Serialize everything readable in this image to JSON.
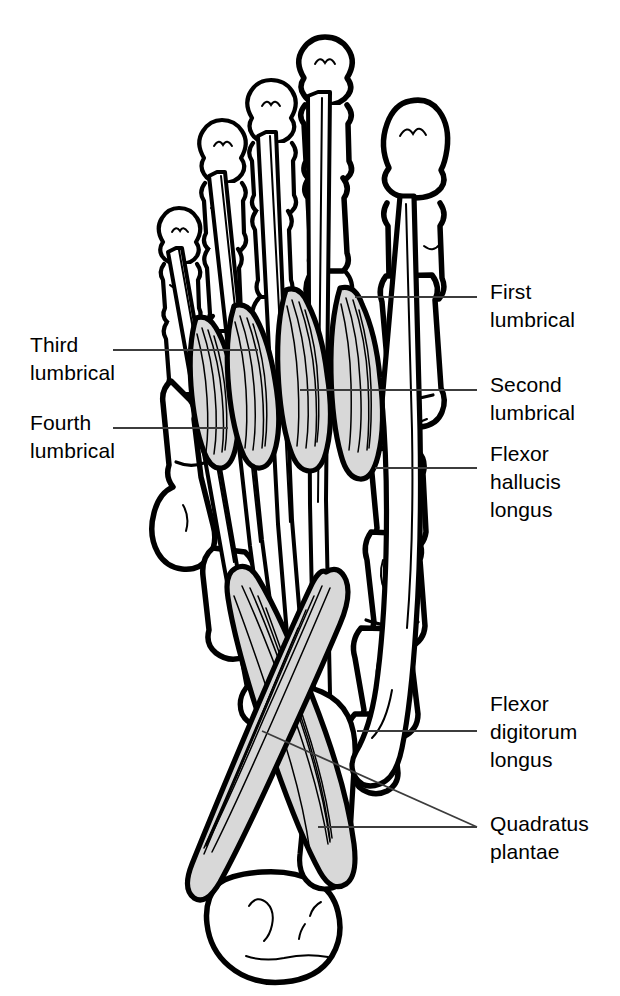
{
  "figure": {
    "background_color": "#ffffff",
    "ink_color": "#000000",
    "muscle_fill_color": "#d8d8d8",
    "bone_fill_color": "#ffffff",
    "leader_color": "#3c3c3c",
    "width": 620,
    "height": 996
  },
  "labels": [
    {
      "id": "first-lumbrical",
      "text": "First\nlumbrical",
      "side": "right",
      "x": 490,
      "y": 278,
      "leader": {
        "x1": 355,
        "y1": 297,
        "x2": 477,
        "y2": 297
      }
    },
    {
      "id": "second-lumbrical",
      "text": "Second\nlumbrical",
      "side": "right",
      "x": 490,
      "y": 371,
      "leader": {
        "x1": 300,
        "y1": 390,
        "x2": 477,
        "y2": 390
      }
    },
    {
      "id": "flexor-hallucis-longus",
      "text": "Flexor\nhallucis\nlongus",
      "side": "right",
      "x": 490,
      "y": 440,
      "leader": {
        "x1": 375,
        "y1": 468,
        "x2": 477,
        "y2": 468
      }
    },
    {
      "id": "flexor-digitorum-longus",
      "text": "Flexor\ndigitorum\nlongus",
      "side": "right",
      "x": 490,
      "y": 690,
      "leader": {
        "x1": 357,
        "y1": 731,
        "x2": 477,
        "y2": 731
      }
    },
    {
      "id": "quadratus-plantae",
      "text": "Quadratus\nplantae",
      "side": "right",
      "x": 490,
      "y": 810,
      "leader_a": {
        "x1": 262,
        "y1": 731,
        "x2": 477,
        "y2": 827
      },
      "leader_b": {
        "x1": 318,
        "y1": 827,
        "x2": 477,
        "y2": 827
      }
    },
    {
      "id": "third-lumbrical",
      "text": "Third\nlumbrical",
      "side": "left",
      "x": 30,
      "y": 331,
      "leader": {
        "x1": 113,
        "y1": 350,
        "x2": 258,
        "y2": 350
      }
    },
    {
      "id": "fourth-lumbrical",
      "text": "Fourth\nlumbrical",
      "side": "left",
      "x": 30,
      "y": 409,
      "leader": {
        "x1": 113,
        "y1": 428,
        "x2": 228,
        "y2": 428
      }
    }
  ],
  "structures": [
    {
      "id": "hallux",
      "name": "Great toe (hallux) phalanges"
    },
    {
      "id": "toe2",
      "name": "Second toe phalanges"
    },
    {
      "id": "toe3",
      "name": "Third toe phalanges"
    },
    {
      "id": "toe4",
      "name": "Fourth toe phalanges"
    },
    {
      "id": "toe5",
      "name": "Fifth toe phalanges"
    },
    {
      "id": "metatarsals",
      "name": "Metatarsal bones"
    },
    {
      "id": "tarsals",
      "name": "Tarsal bones (cuneiforms, cuboid, navicular)"
    },
    {
      "id": "calcaneus",
      "name": "Calcaneus (heel bone)"
    },
    {
      "id": "fdl-tendons",
      "name": "Flexor digitorum longus tendons"
    },
    {
      "id": "fhl-tendon",
      "name": "Flexor hallucis longus tendon"
    },
    {
      "id": "lumbrical-1",
      "name": "First lumbrical muscle"
    },
    {
      "id": "lumbrical-2",
      "name": "Second lumbrical muscle"
    },
    {
      "id": "lumbrical-3",
      "name": "Third lumbrical muscle"
    },
    {
      "id": "lumbrical-4",
      "name": "Fourth lumbrical muscle"
    },
    {
      "id": "quadratus-plantae-medial",
      "name": "Quadratus plantae, medial head"
    },
    {
      "id": "quadratus-plantae-lateral",
      "name": "Quadratus plantae, lateral head"
    }
  ]
}
